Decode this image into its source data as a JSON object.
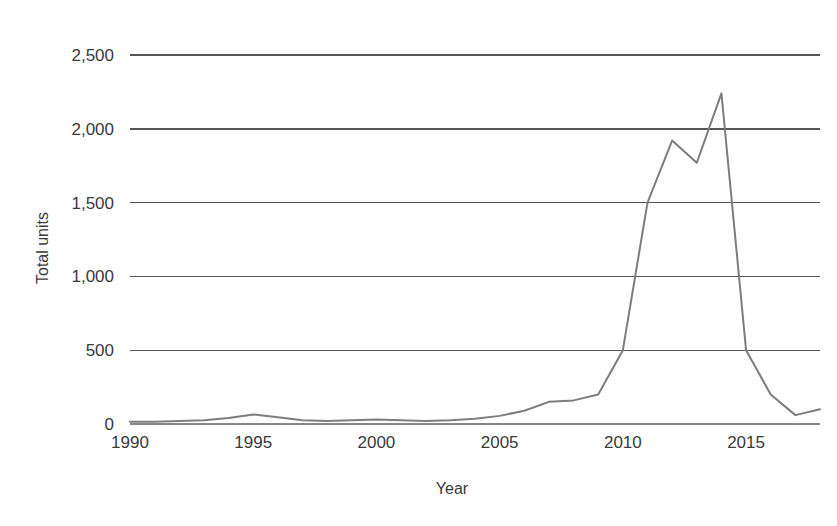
{
  "chart_data": {
    "type": "line",
    "title": "",
    "subtitle": "",
    "xlabel": "Year",
    "ylabel": "Total units",
    "xlim": [
      1990,
      2018
    ],
    "ylim": [
      0,
      2500
    ],
    "grid": true,
    "legend": false,
    "legend_position": "none",
    "line_color": "#7d7d7d",
    "gridline_color": "#555555",
    "background_color": "#ffffff",
    "x_tick_labels": [
      "1990",
      "1995",
      "2000",
      "2005",
      "2010",
      "2015"
    ],
    "x_tick_values": [
      1990,
      1995,
      2000,
      2005,
      2010,
      2015
    ],
    "y_tick_labels": [
      "0",
      "500",
      "1,000",
      "1,500",
      "2,000",
      "2,500"
    ],
    "y_tick_values": [
      0,
      500,
      1000,
      1500,
      2000,
      2500
    ],
    "x": [
      1990,
      1991,
      1992,
      1993,
      1994,
      1995,
      1996,
      1997,
      1998,
      1999,
      2000,
      2001,
      2002,
      2003,
      2004,
      2005,
      2006,
      2007,
      2008,
      2009,
      2010,
      2011,
      2012,
      2013,
      2014,
      2015,
      2016,
      2017,
      2018
    ],
    "series": [
      {
        "name": "Total units",
        "values": [
          15,
          15,
          20,
          25,
          40,
          65,
          45,
          25,
          20,
          25,
          30,
          25,
          20,
          25,
          35,
          55,
          90,
          150,
          160,
          200,
          500,
          1500,
          1920,
          1770,
          2240,
          500,
          200,
          60,
          100
        ]
      }
    ],
    "annotations": []
  },
  "axes": {
    "y_title": "Total units",
    "x_title": "Year"
  }
}
